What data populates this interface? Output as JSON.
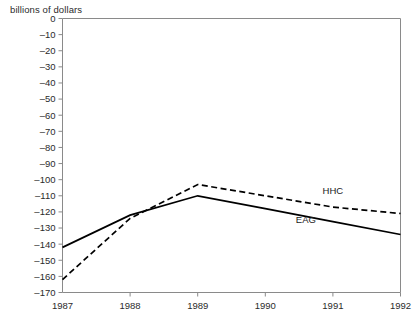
{
  "axis_unit_label": "billions of dollars",
  "series_labels": {
    "hhc": "HHC",
    "eag": "EAG"
  },
  "chart_data": {
    "type": "line",
    "title": "",
    "xlabel": "",
    "ylabel": "billions of dollars",
    "x": [
      1987,
      1988,
      1989,
      1990,
      1991,
      1992
    ],
    "categories": [
      "1987",
      "1988",
      "1989",
      "1990",
      "1991",
      "1992"
    ],
    "xlim": [
      1987,
      1992
    ],
    "ylim": [
      -170,
      0
    ],
    "ytick_values": [
      0,
      -10,
      -20,
      -30,
      -40,
      -50,
      -60,
      -70,
      -80,
      -90,
      -100,
      -110,
      -120,
      -130,
      -140,
      -150,
      -160,
      -170
    ],
    "ytick_labels": [
      "0",
      "–10",
      "–20",
      "–30",
      "–40",
      "–50",
      "–60",
      "–70",
      "–80",
      "–90",
      "–100",
      "–110",
      "–120",
      "–130",
      "–140",
      "–150",
      "–160",
      "–170"
    ],
    "xtick_labels": [
      "1987",
      "1988",
      "1989",
      "1990",
      "1991",
      "1992"
    ],
    "grid": false,
    "legend_position": "inline-annotation",
    "series": [
      {
        "name": "HHC",
        "style": "dashed",
        "color": "#000000",
        "values": [
          -162,
          -124,
          -103,
          -110,
          -117,
          -121
        ]
      },
      {
        "name": "EAG",
        "style": "solid",
        "color": "#000000",
        "values": [
          -142,
          -122,
          -110,
          -118,
          -126,
          -134
        ]
      }
    ],
    "annotations": [
      {
        "text": "HHC",
        "x": 1991.0,
        "y": -109
      },
      {
        "text": "EAG",
        "x": 1990.6,
        "y": -127
      }
    ]
  }
}
